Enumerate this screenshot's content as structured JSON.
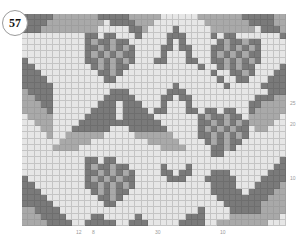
{
  "chart_number": "57",
  "colors": {
    "light": "#e6e6e6",
    "mid": "#a9a9a9",
    "dark": "#7a7a7a",
    "gridline": "#c4c4c4"
  },
  "chart_data": {
    "type": "heatmap",
    "title": "57",
    "cols": 42,
    "rows": 34,
    "legend": {
      ".": "light",
      "d": "dark",
      "m": "mid"
    },
    "row_labels": [
      {
        "label": "25",
        "row": 14
      },
      {
        "label": "20",
        "row": 17
      },
      {
        "label": "10",
        "row": 26
      }
    ],
    "col_labels": [
      {
        "label": "12",
        "col": 9
      },
      {
        "label": "8",
        "col": 11
      },
      {
        "label": "30",
        "col": 21
      },
      {
        "label": "10",
        "col": 31
      }
    ],
    "grid": [
      "dddddmmmmmmmdddddmmmmm......mmmmmmmdddddmm",
      "ddddmmmmmmmmm.ddddmmm........mmmmmmmddddmm",
      "dddmmmmmmmmm.....ddm....d.....mmmmmmm.dddm",
      "..........dd.dd...d....ddd....d.dd.......d",
      "..........dmddmdd......d.d.....dmddmdd....",
      "..........ddmdmdmd....dd.dd...ddmdmdmd....",
      "..........dmdmdmdd....d...d...dmdmdmdd....",
      "d.........ddmdmdmd...dd...dd..ddmdmdmd....",
      "dd.........dmdmdd...........d..dmdmdd....d",
      "ddd.........ddmd..............d..ddmd...dd",
      "dddd.........dd................d..dd...ddd",
      "ddddd...................d.......d.....dddd",
      "mdddd.........ddd......ddd.............ddd",
      "mmddd........ddddd....dd.dd..........dddmm",
      "mmmdd.......ddd.ddd...d...d.........ddmmmm",
      "mmmmd......dddd.dddd.dd...dd.dd.dd..dmmmmm",
      ".mmmm.....ddddd.ddddd.......dmddmdd.mmmmm.",
      "..mmm....ddddddddddddd......ddmdmdmdmmmm..",
      "...mm...dddddd...dddddd.....dmdmdmdd.mm...",
      "....m..mmmmmm.....mmmmmm....ddmdmdmd......",
      "......mmmmm.........mmmmm....dmdmdd.......",
      ".....mmmm.............mmmm....ddmd........",
      "..............................dd..........",
      "..........dd.dd..........................d",
      "..........dmddmdd.....d...d.............dd",
      "..........ddmdmdmd....dd.dd...ddd......ddd",
      "d.........dmdmdmdd.....ddd...ddddd....dddd",
      "dd........ddmdmdmd............dddd...ddddm",
      "ddd........dmdmdd.............ddddd.ddddmm",
      "dddd........ddmd...............ddddddddmmm",
      "ddddd........dd.................ddddddmmmm",
      "mmdddd......................d....dddddmmmm",
      "mmmdddd....dd.....d.......ddd....mmmmmmmm.",
      "mmmmdddd..ddddd..ddd.....dddd..mmmmmmmm..."
    ]
  }
}
